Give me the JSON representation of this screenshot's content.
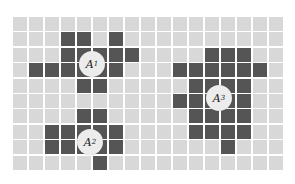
{
  "grid": {
    "cols": 17,
    "rows": 10,
    "pitch_x": 16,
    "pitch_y": 15.4,
    "colors": {
      "empty": "#d8d8d8",
      "filled": "#555555",
      "marker": "#ececec",
      "background": "#ffffff"
    },
    "filled_cells": [
      [
        1,
        3
      ],
      [
        1,
        4
      ],
      [
        1,
        6
      ],
      [
        2,
        3
      ],
      [
        2,
        4
      ],
      [
        2,
        5
      ],
      [
        2,
        6
      ],
      [
        2,
        7
      ],
      [
        3,
        1
      ],
      [
        3,
        2
      ],
      [
        3,
        3
      ],
      [
        3,
        4
      ],
      [
        3,
        5
      ],
      [
        3,
        6
      ],
      [
        4,
        4
      ],
      [
        4,
        5
      ],
      [
        6,
        4
      ],
      [
        6,
        5
      ],
      [
        7,
        2
      ],
      [
        7,
        3
      ],
      [
        7,
        4
      ],
      [
        7,
        5
      ],
      [
        7,
        6
      ],
      [
        8,
        2
      ],
      [
        8,
        3
      ],
      [
        8,
        4
      ],
      [
        8,
        5
      ],
      [
        8,
        6
      ],
      [
        9,
        5
      ],
      [
        2,
        12
      ],
      [
        2,
        13
      ],
      [
        2,
        14
      ],
      [
        3,
        10
      ],
      [
        3,
        11
      ],
      [
        3,
        12
      ],
      [
        3,
        13
      ],
      [
        3,
        14
      ],
      [
        3,
        15
      ],
      [
        4,
        11
      ],
      [
        4,
        12
      ],
      [
        4,
        13
      ],
      [
        4,
        14
      ],
      [
        5,
        10
      ],
      [
        5,
        11
      ],
      [
        5,
        12
      ],
      [
        5,
        13
      ],
      [
        5,
        14
      ],
      [
        6,
        11
      ],
      [
        6,
        12
      ],
      [
        6,
        13
      ],
      [
        6,
        14
      ],
      [
        7,
        11
      ],
      [
        7,
        12
      ],
      [
        7,
        13
      ],
      [
        7,
        14
      ],
      [
        8,
        13
      ]
    ]
  },
  "markers": [
    {
      "label": "A",
      "subscript": "1",
      "x": 92,
      "y": 64
    },
    {
      "label": "A",
      "subscript": "2",
      "x": 90,
      "y": 142
    },
    {
      "label": "A",
      "subscript": "3",
      "x": 219,
      "y": 98
    }
  ]
}
